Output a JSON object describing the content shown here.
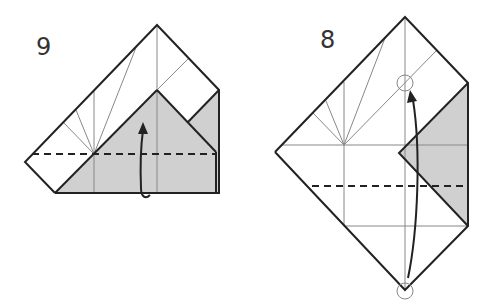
{
  "diagram": {
    "colors": {
      "edge": "#222222",
      "crease": "#888888",
      "shade": "#d0d0d0",
      "background": "#ffffff"
    },
    "steps": [
      {
        "label": "9",
        "instruction_icon": "valley-fold-up-arrow",
        "fold_line": "dashed horizontal valley fold",
        "shaded_region": "colored side of paper (triangle and bottom band)"
      },
      {
        "label": "8",
        "instruction_icon": "valley-fold-up-arrow",
        "fold_line": "dashed horizontal valley fold",
        "reference_marks": [
          "circle-top-target",
          "circle-bottom-corner"
        ],
        "shaded_region": "colored side of paper (right triangular flap)"
      }
    ]
  }
}
